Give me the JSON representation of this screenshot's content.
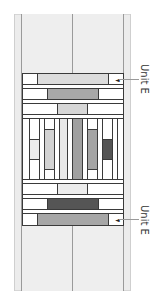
{
  "diagram": {
    "type": "quilt-block-assembly",
    "colors": {
      "frame": "#ececec",
      "outline": "#3a3a3a",
      "white": "#ffffff",
      "light_gray": "#d9d9d9",
      "pale_gray": "#e8e8e8",
      "mid_gray": "#a8a8a8",
      "gray": "#9c9c9c",
      "dark_gray": "#555555"
    },
    "labels": {
      "top_unit": "Unit E",
      "bottom_unit": "Unit E"
    },
    "arrow_glyph": "◄"
  }
}
